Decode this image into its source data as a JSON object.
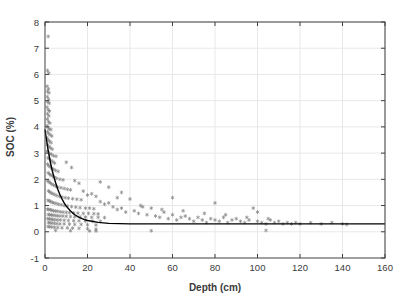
{
  "chart_data": {
    "type": "scatter",
    "title": "",
    "xlabel": "Depth (cm)",
    "ylabel": "SOC (%)",
    "xlim": [
      0,
      160
    ],
    "ylim": [
      -1,
      8
    ],
    "xticks": [
      0,
      20,
      40,
      60,
      80,
      100,
      120,
      140,
      160
    ],
    "yticks": [
      -1,
      0,
      1,
      2,
      3,
      4,
      5,
      6,
      7,
      8
    ],
    "grid": true,
    "legend": "none",
    "marker_color": "#808080",
    "line_color": "#000000",
    "axis_color": "#404040",
    "grid_color": "#e8e8e8",
    "background": "#ffffff",
    "series": [
      {
        "name": "SOC observations",
        "type": "scatter",
        "marker": "asterisk",
        "points": [
          [
            1.5,
            7.45
          ],
          [
            1.2,
            6.15
          ],
          [
            1.8,
            6.05
          ],
          [
            1.0,
            5.55
          ],
          [
            1.6,
            5.45
          ],
          [
            1.2,
            5.35
          ],
          [
            1.9,
            5.3
          ],
          [
            1.1,
            5.15
          ],
          [
            1.7,
            5.05
          ],
          [
            1.3,
            4.95
          ],
          [
            2.0,
            4.9
          ],
          [
            1.0,
            4.75
          ],
          [
            1.5,
            4.65
          ],
          [
            2.1,
            4.6
          ],
          [
            1.2,
            4.5
          ],
          [
            1.8,
            4.42
          ],
          [
            1.1,
            4.3
          ],
          [
            1.6,
            4.2
          ],
          [
            2.3,
            4.15
          ],
          [
            1.0,
            4.05
          ],
          [
            1.4,
            3.98
          ],
          [
            2.0,
            3.92
          ],
          [
            2.8,
            3.9
          ],
          [
            1.2,
            3.82
          ],
          [
            1.7,
            3.75
          ],
          [
            2.4,
            3.7
          ],
          [
            3.2,
            3.65
          ],
          [
            1.0,
            3.58
          ],
          [
            1.5,
            3.5
          ],
          [
            2.1,
            3.45
          ],
          [
            2.9,
            3.4
          ],
          [
            1.3,
            3.32
          ],
          [
            1.9,
            3.25
          ],
          [
            2.5,
            3.2
          ],
          [
            3.4,
            3.15
          ],
          [
            1.1,
            3.08
          ],
          [
            1.6,
            3.02
          ],
          [
            2.2,
            2.98
          ],
          [
            3.0,
            2.95
          ],
          [
            4.0,
            2.9
          ],
          [
            5.2,
            2.88
          ],
          [
            1.4,
            2.82
          ],
          [
            2.0,
            2.78
          ],
          [
            2.7,
            2.72
          ],
          [
            3.6,
            2.68
          ],
          [
            4.5,
            2.62
          ],
          [
            1.2,
            2.58
          ],
          [
            1.8,
            2.52
          ],
          [
            2.4,
            2.48
          ],
          [
            3.1,
            2.42
          ],
          [
            4.0,
            2.38
          ],
          [
            5.0,
            2.34
          ],
          [
            6.2,
            2.3
          ],
          [
            1.5,
            2.25
          ],
          [
            2.1,
            2.2
          ],
          [
            2.8,
            2.16
          ],
          [
            3.5,
            2.12
          ],
          [
            4.4,
            2.08
          ],
          [
            5.5,
            2.04
          ],
          [
            7.0,
            2.0
          ],
          [
            8.5,
            1.98
          ],
          [
            1.3,
            1.94
          ],
          [
            1.9,
            1.9
          ],
          [
            2.5,
            1.86
          ],
          [
            3.2,
            1.82
          ],
          [
            4.0,
            1.78
          ],
          [
            5.0,
            1.74
          ],
          [
            6.0,
            1.7
          ],
          [
            7.5,
            1.68
          ],
          [
            9.0,
            1.65
          ],
          [
            10.5,
            1.62
          ],
          [
            12.0,
            1.6
          ],
          [
            1.6,
            1.56
          ],
          [
            2.2,
            1.52
          ],
          [
            2.9,
            1.48
          ],
          [
            3.7,
            1.45
          ],
          [
            4.6,
            1.42
          ],
          [
            5.6,
            1.38
          ],
          [
            6.8,
            1.35
          ],
          [
            8.0,
            1.32
          ],
          [
            9.5,
            1.3
          ],
          [
            11.0,
            1.28
          ],
          [
            13.0,
            1.26
          ],
          [
            15.0,
            1.24
          ],
          [
            17.0,
            1.22
          ],
          [
            1.4,
            1.2
          ],
          [
            2.0,
            1.18
          ],
          [
            2.7,
            1.15
          ],
          [
            3.4,
            1.12
          ],
          [
            4.2,
            1.1
          ],
          [
            5.2,
            1.08
          ],
          [
            6.3,
            1.05
          ],
          [
            7.6,
            1.03
          ],
          [
            9.0,
            1.0
          ],
          [
            10.5,
            0.98
          ],
          [
            12.5,
            0.96
          ],
          [
            14.5,
            0.94
          ],
          [
            16.5,
            0.92
          ],
          [
            19.0,
            0.9
          ],
          [
            21.0,
            0.9
          ],
          [
            23.0,
            0.88
          ],
          [
            1.2,
            0.86
          ],
          [
            1.8,
            0.85
          ],
          [
            2.5,
            0.84
          ],
          [
            3.2,
            0.82
          ],
          [
            4.0,
            0.8
          ],
          [
            5.0,
            0.79
          ],
          [
            6.0,
            0.78
          ],
          [
            7.2,
            0.76
          ],
          [
            8.5,
            0.75
          ],
          [
            10.0,
            0.74
          ],
          [
            11.5,
            0.73
          ],
          [
            13.5,
            0.72
          ],
          [
            15.5,
            0.71
          ],
          [
            18.0,
            0.7
          ],
          [
            20.5,
            0.7
          ],
          [
            23.0,
            0.69
          ],
          [
            25.0,
            0.68
          ],
          [
            1.5,
            0.66
          ],
          [
            2.2,
            0.65
          ],
          [
            3.0,
            0.64
          ],
          [
            3.8,
            0.63
          ],
          [
            4.8,
            0.62
          ],
          [
            5.8,
            0.61
          ],
          [
            7.0,
            0.6
          ],
          [
            8.4,
            0.6
          ],
          [
            10.0,
            0.59
          ],
          [
            12.0,
            0.58
          ],
          [
            14.0,
            0.57
          ],
          [
            16.5,
            0.57
          ],
          [
            19.0,
            0.56
          ],
          [
            22.0,
            0.55
          ],
          [
            25.0,
            0.55
          ],
          [
            28.0,
            0.54
          ],
          [
            1.3,
            0.5
          ],
          [
            2.0,
            0.49
          ],
          [
            2.8,
            0.48
          ],
          [
            3.6,
            0.47
          ],
          [
            4.6,
            0.46
          ],
          [
            5.8,
            0.45
          ],
          [
            7.2,
            0.45
          ],
          [
            9.0,
            0.44
          ],
          [
            11.0,
            0.43
          ],
          [
            13.5,
            0.42
          ],
          [
            16.0,
            0.42
          ],
          [
            19.0,
            0.41
          ],
          [
            22.5,
            0.4
          ],
          [
            26.0,
            0.4
          ],
          [
            1.6,
            0.35
          ],
          [
            2.4,
            0.34
          ],
          [
            3.3,
            0.33
          ],
          [
            4.4,
            0.32
          ],
          [
            5.6,
            0.31
          ],
          [
            7.0,
            0.3
          ],
          [
            9.0,
            0.3
          ],
          [
            11.5,
            0.29
          ],
          [
            14.0,
            0.28
          ],
          [
            17.0,
            0.28
          ],
          [
            20.0,
            0.27
          ],
          [
            24.0,
            0.26
          ],
          [
            1.4,
            0.2
          ],
          [
            2.2,
            0.19
          ],
          [
            3.2,
            0.18
          ],
          [
            4.5,
            0.17
          ],
          [
            6.0,
            0.16
          ],
          [
            8.0,
            0.15
          ],
          [
            10.5,
            0.15
          ],
          [
            13.0,
            0.14
          ],
          [
            16.0,
            0.13
          ],
          [
            20.0,
            0.12
          ],
          [
            24.0,
            0.1
          ],
          [
            5.0,
            0.05
          ],
          [
            12.0,
            0.04
          ],
          [
            21.0,
            0.03
          ],
          [
            24.0,
            0.03
          ],
          [
            50.0,
            0.04
          ],
          [
            10.0,
            2.65
          ],
          [
            12.5,
            2.45
          ],
          [
            14.0,
            1.95
          ],
          [
            16.0,
            1.85
          ],
          [
            18.0,
            1.55
          ],
          [
            20.0,
            1.4
          ],
          [
            22.0,
            1.45
          ],
          [
            24.0,
            1.35
          ],
          [
            26.0,
            1.15
          ],
          [
            28.0,
            1.05
          ],
          [
            30.0,
            1.1
          ],
          [
            32.0,
            0.95
          ],
          [
            34.0,
            0.85
          ],
          [
            36.0,
            0.9
          ],
          [
            38.0,
            0.75
          ],
          [
            26.0,
            1.9
          ],
          [
            30.0,
            1.7
          ],
          [
            34.0,
            1.3
          ],
          [
            36.0,
            1.5
          ],
          [
            40.0,
            1.25
          ],
          [
            42.0,
            0.8
          ],
          [
            44.0,
            0.7
          ],
          [
            46.0,
            0.95
          ],
          [
            48.0,
            0.65
          ],
          [
            50.0,
            0.9
          ],
          [
            52.0,
            0.6
          ],
          [
            54.0,
            0.55
          ],
          [
            56.0,
            0.75
          ],
          [
            58.0,
            0.5
          ],
          [
            60.0,
            0.65
          ],
          [
            60.0,
            1.3
          ],
          [
            62.0,
            0.45
          ],
          [
            64.0,
            0.55
          ],
          [
            66.0,
            0.6
          ],
          [
            68.0,
            0.5
          ],
          [
            70.0,
            0.4
          ],
          [
            72.0,
            0.55
          ],
          [
            74.0,
            0.45
          ],
          [
            76.0,
            0.35
          ],
          [
            78.0,
            0.5
          ],
          [
            80.0,
            1.1
          ],
          [
            80.0,
            0.45
          ],
          [
            82.0,
            0.4
          ],
          [
            84.0,
            0.55
          ],
          [
            86.0,
            0.35
          ],
          [
            88.0,
            0.45
          ],
          [
            90.0,
            0.5
          ],
          [
            92.0,
            0.4
          ],
          [
            94.0,
            0.35
          ],
          [
            96.0,
            0.45
          ],
          [
            98.0,
            0.9
          ],
          [
            100.0,
            0.4
          ],
          [
            100.0,
            0.75
          ],
          [
            102.0,
            0.35
          ],
          [
            104.0,
            0.3
          ],
          [
            104.0,
            0.05
          ],
          [
            106.0,
            0.45
          ],
          [
            108.0,
            0.35
          ],
          [
            110.0,
            0.4
          ],
          [
            112.0,
            0.3
          ],
          [
            114.0,
            0.35
          ],
          [
            116.0,
            0.3
          ],
          [
            118.0,
            0.35
          ],
          [
            120.0,
            0.3
          ],
          [
            125.0,
            0.35
          ],
          [
            130.0,
            0.3
          ],
          [
            135.0,
            0.35
          ],
          [
            140.0,
            0.3
          ],
          [
            142.0,
            0.28
          ],
          [
            45.0,
            1.0
          ],
          [
            55.0,
            0.85
          ],
          [
            65.0,
            0.8
          ],
          [
            75.0,
            0.7
          ],
          [
            85.0,
            0.65
          ],
          [
            95.0,
            0.55
          ],
          [
            105.0,
            0.5
          ]
        ]
      },
      {
        "name": "Fitted exponential decay",
        "type": "line",
        "description": "SOC = 0.3 + 3.6 * exp(-x/6)",
        "model": {
          "asymptote": 0.3,
          "amplitude": 3.6,
          "decay_length": 6.0
        },
        "points": [
          [
            0.0,
            3.9
          ],
          [
            0.5,
            3.62
          ],
          [
            1.0,
            3.35
          ],
          [
            1.5,
            3.1
          ],
          [
            2.0,
            2.88
          ],
          [
            2.5,
            2.67
          ],
          [
            3.0,
            2.48
          ],
          [
            3.5,
            2.3
          ],
          [
            4.0,
            2.15
          ],
          [
            4.5,
            2.0
          ],
          [
            5.0,
            1.87
          ],
          [
            6.0,
            1.62
          ],
          [
            7.0,
            1.42
          ],
          [
            8.0,
            1.25
          ],
          [
            9.0,
            1.1
          ],
          [
            10.0,
            0.98
          ],
          [
            12.0,
            0.79
          ],
          [
            14.0,
            0.65
          ],
          [
            16.0,
            0.55
          ],
          [
            18.0,
            0.48
          ],
          [
            20.0,
            0.43
          ],
          [
            25.0,
            0.36
          ],
          [
            30.0,
            0.32
          ],
          [
            35.0,
            0.31
          ],
          [
            40.0,
            0.3
          ],
          [
            50.0,
            0.3
          ],
          [
            60.0,
            0.3
          ],
          [
            80.0,
            0.3
          ],
          [
            100.0,
            0.3
          ],
          [
            120.0,
            0.3
          ],
          [
            140.0,
            0.3
          ],
          [
            160.0,
            0.3
          ]
        ]
      }
    ]
  },
  "figure": {
    "xlabel": "Depth (cm)",
    "ylabel": "SOC (%)"
  }
}
